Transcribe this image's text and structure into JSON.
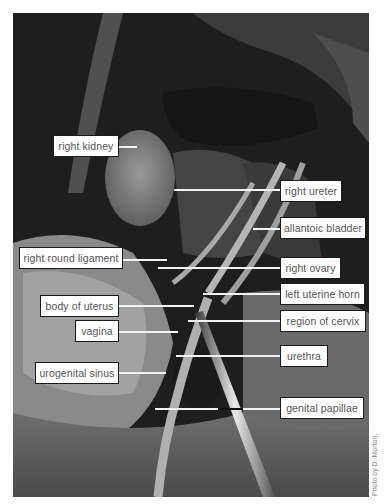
{
  "figure": {
    "credit": "Photo by D. Morton.",
    "labels": [
      {
        "id": "right-kidney",
        "text": "right kidney",
        "side": "left"
      },
      {
        "id": "right-ureter",
        "text": "right ureter",
        "side": "right"
      },
      {
        "id": "allantoic-bladder",
        "text": "allantoic bladder",
        "side": "right"
      },
      {
        "id": "right-round-ligament",
        "text": "right round ligament",
        "side": "left"
      },
      {
        "id": "right-ovary",
        "text": "right ovary",
        "side": "right"
      },
      {
        "id": "left-uterine-horn",
        "text": "left uterine horn",
        "side": "right"
      },
      {
        "id": "body-of-uterus",
        "text": "body of uterus",
        "side": "left"
      },
      {
        "id": "vagina",
        "text": "vagina",
        "side": "left"
      },
      {
        "id": "region-of-cervix",
        "text": "region of cervix",
        "side": "right"
      },
      {
        "id": "urogenital-sinus",
        "text": "urogenital sinus",
        "side": "left"
      },
      {
        "id": "urethra",
        "text": "urethra",
        "side": "right"
      },
      {
        "id": "genital-papillae",
        "text": "genital papillae",
        "side": "right"
      }
    ]
  }
}
